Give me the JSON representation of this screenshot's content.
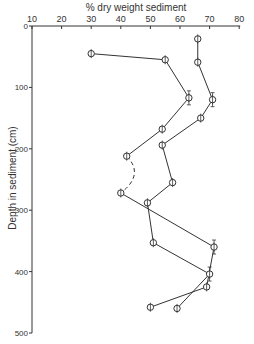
{
  "chart_data": {
    "type": "line",
    "title": "",
    "xlabel": "% dry weight sediment",
    "ylabel": "Depth in sediment (cm)",
    "x_axis_position": "top",
    "y_axis_inverted": true,
    "xlim": [
      10,
      80
    ],
    "ylim": [
      0,
      500
    ],
    "x_ticks": [
      "10",
      "20",
      "30",
      "40",
      "50",
      "60",
      "70",
      "80"
    ],
    "y_ticks": [
      "0",
      "100",
      "200",
      "300",
      "400",
      "500"
    ],
    "grid": false,
    "legend": null,
    "series": [
      {
        "name": "Series A",
        "marker": "circle-with-cross",
        "points": [
          {
            "x": 30,
            "depth": 45
          },
          {
            "x": 55,
            "depth": 55
          },
          {
            "x": 63,
            "depth": 117,
            "error_bar": true
          },
          {
            "x": 54,
            "depth": 168
          },
          {
            "x": 42,
            "depth": 212
          },
          {
            "x": 40,
            "depth": 272,
            "dashed_from_previous": true
          },
          {
            "x": 71.5,
            "depth": 360,
            "error_bar": true
          },
          {
            "x": 69,
            "depth": 425
          },
          {
            "x": 50,
            "depth": 458
          }
        ]
      },
      {
        "name": "Series B",
        "marker": "circle-with-cross",
        "points": [
          {
            "x": 66,
            "depth": 21
          },
          {
            "x": 66,
            "depth": 59
          },
          {
            "x": 71,
            "depth": 120,
            "error_bar": true
          },
          {
            "x": 67,
            "depth": 150
          },
          {
            "x": 54,
            "depth": 194
          },
          {
            "x": 57.5,
            "depth": 255
          },
          {
            "x": 49,
            "depth": 288
          },
          {
            "x": 51,
            "depth": 353
          },
          {
            "x": 70,
            "depth": 404,
            "error_bar": true
          },
          {
            "x": 59,
            "depth": 460
          }
        ]
      }
    ]
  },
  "axes": {
    "x_title": "% dry weight sediment",
    "y_title": "Depth in sediment (cm)",
    "x_tick_labels": [
      "10",
      "20",
      "30",
      "40",
      "50",
      "60",
      "70",
      "80"
    ],
    "y_tick_labels": [
      "0",
      "100",
      "200",
      "300",
      "400",
      "500"
    ]
  },
  "colors": {
    "ink": "#333333",
    "background": "#ffffff"
  }
}
